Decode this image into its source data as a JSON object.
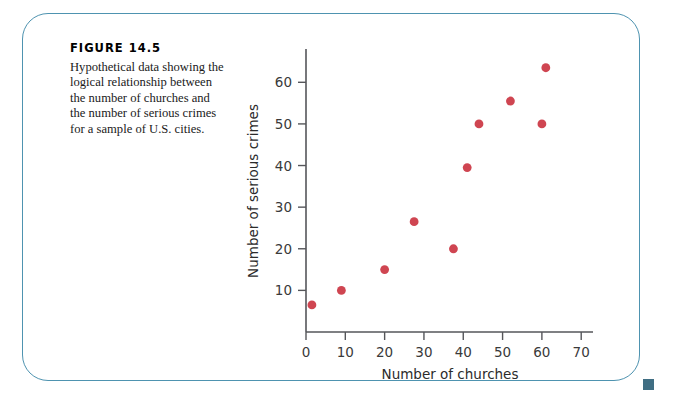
{
  "figure": {
    "number_label": "FIGURE 14.5",
    "caption_lines": [
      "Hypothetical data showing the",
      "logical relationship between",
      "the number of churches and",
      "the number of serious crimes",
      "for a sample of U.S. cities."
    ],
    "border_color": "#4e93b0",
    "corner_marker_color": "#3f6e83"
  },
  "chart_data": {
    "type": "scatter",
    "title": "",
    "xlabel": "Number of churches",
    "ylabel": "Number of serious crimes",
    "xlim": [
      0,
      73
    ],
    "ylim": [
      0,
      68
    ],
    "xticks": [
      0,
      10,
      20,
      30,
      40,
      50,
      60,
      70
    ],
    "xtick_labels": [
      "0",
      "10",
      "20",
      "30",
      "40",
      "50",
      "60",
      "70"
    ],
    "yticks": [
      10,
      20,
      30,
      40,
      50,
      60
    ],
    "ytick_labels": [
      "10",
      "20",
      "30",
      "40",
      "50",
      "60"
    ],
    "grid": false,
    "legend": null,
    "marker_color": "#cf4551",
    "marker_size": 4.4,
    "points": [
      {
        "x": 1.5,
        "y": 6.5
      },
      {
        "x": 9.0,
        "y": 10.0
      },
      {
        "x": 20.0,
        "y": 15.0
      },
      {
        "x": 27.5,
        "y": 26.5
      },
      {
        "x": 37.5,
        "y": 20.0
      },
      {
        "x": 41.0,
        "y": 39.5
      },
      {
        "x": 44.0,
        "y": 50.0
      },
      {
        "x": 52.0,
        "y": 55.5
      },
      {
        "x": 60.0,
        "y": 50.0
      },
      {
        "x": 61.0,
        "y": 63.5
      }
    ]
  }
}
